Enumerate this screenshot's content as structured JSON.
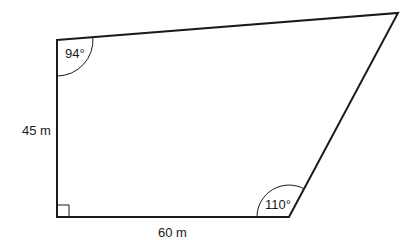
{
  "diagram": {
    "type": "quadrilateral",
    "vertices": {
      "top_left": [
        57,
        40
      ],
      "top_right": [
        398,
        13
      ],
      "bottom_right": [
        289,
        217
      ],
      "bottom_left": [
        57,
        217
      ]
    },
    "labels": {
      "left_side": "45 m",
      "bottom_side": "60 m",
      "angle_top_left": "94°",
      "angle_bottom_right": "110°"
    },
    "right_angle_marker": "bottom_left",
    "colors": {
      "stroke": "#1a1a1a",
      "background": "#ffffff"
    }
  }
}
